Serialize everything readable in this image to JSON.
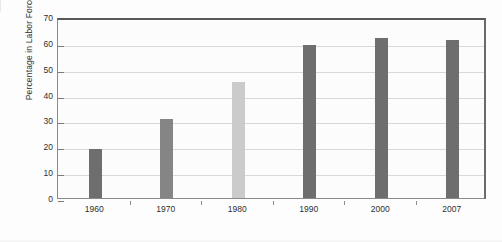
{
  "chart_data": {
    "type": "bar",
    "title": "",
    "subtitle": "",
    "xlabel": "",
    "ylabel": "Percentage in Labor Force",
    "categories": [
      "1960",
      "1970",
      "1980",
      "1990",
      "2000",
      "2007"
    ],
    "values": [
      19,
      30.5,
      45,
      59,
      62,
      61
    ],
    "series": [
      {
        "name": "Percentage in Labor Force",
        "values": [
          19,
          30.5,
          45,
          59,
          62,
          61
        ]
      }
    ],
    "bar_colors": [
      "#6e6e6e",
      "#858585",
      "#cbcbcb",
      "#6e6e6e",
      "#6e6e6e",
      "#6e6e6e"
    ],
    "ylim": [
      0,
      70
    ],
    "xlim_labels": [
      "1960",
      "2007"
    ],
    "y_ticks": [
      0,
      10,
      20,
      30,
      40,
      50,
      60,
      70
    ],
    "y_tick_labels": [
      "0",
      "10",
      "20",
      "30",
      "40",
      "50",
      "60",
      "70"
    ],
    "grid": true,
    "grid_axis": "y",
    "legend": false,
    "legend_position": "none",
    "annotations": []
  },
  "colors": {
    "bar_dark": "#6e6e6e",
    "bar_mid": "#858585",
    "bar_light": "#cbcbcb",
    "gridline": "#d8d8d8",
    "axis_line": "#8a8a8a",
    "frame_top": "#595959",
    "plot_background": "#fcfcfc",
    "page_background": "#ffffff",
    "text": "#2f2f2f"
  }
}
